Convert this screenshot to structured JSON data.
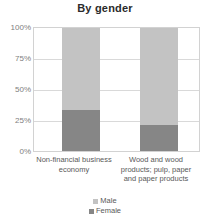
{
  "chart_data": {
    "type": "bar",
    "title": "By gender",
    "xlabel": "",
    "ylabel": "",
    "ylim": [
      0,
      100
    ],
    "grid": true,
    "stacked": true,
    "stack_total": 100,
    "legend_position": "bottom",
    "categories": [
      "Non-financial business economy",
      "Wood and wood products; pulp, paper and paper products"
    ],
    "ticks": [
      "0%",
      "25%",
      "50%",
      "75%",
      "100%"
    ],
    "tick_values": [
      0,
      25,
      50,
      75,
      100
    ],
    "series": [
      {
        "name": "Male",
        "values": [
          67,
          79
        ],
        "color": "#c3c3c3"
      },
      {
        "name": "Female",
        "values": [
          33,
          21
        ],
        "color": "#868686"
      }
    ]
  },
  "colors": {
    "male": "#c3c3c3",
    "female": "#868686",
    "grid": "#d9d9d9",
    "frame": "#d2d2d2",
    "text": "#595959",
    "title": "#2b2b2b"
  }
}
